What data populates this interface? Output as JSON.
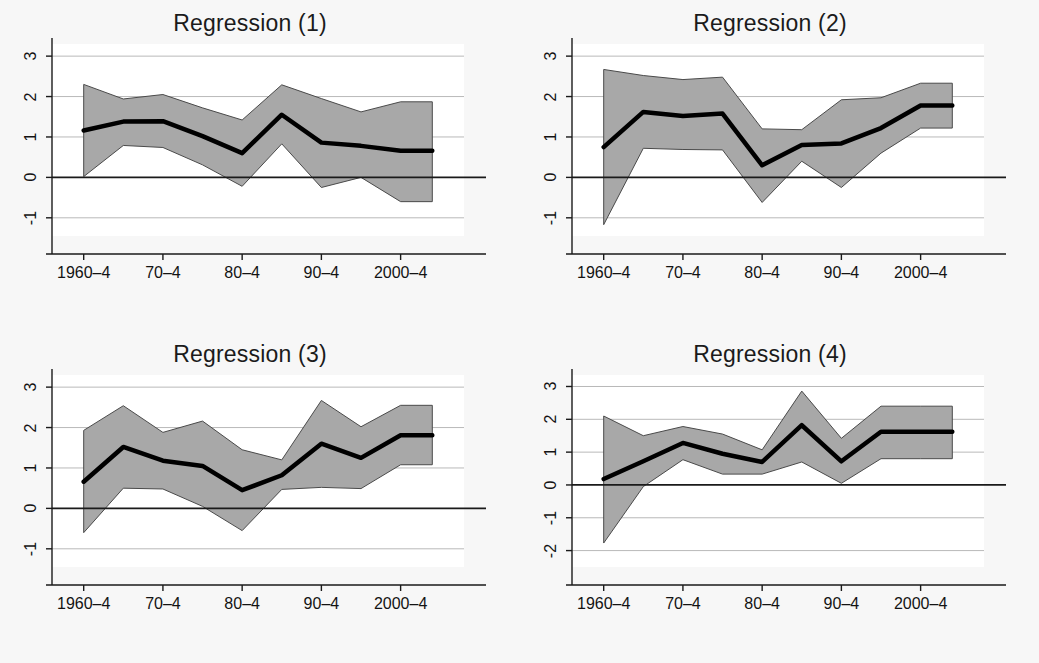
{
  "figure": {
    "background_color": "#f7f7f7",
    "plot_background_color": "#ffffff",
    "band_color": "#a8a8a8",
    "line_color": "#000000",
    "grid_color": "#b9b9b9",
    "axis_color": "#1a1a1a"
  },
  "chart_data": [
    {
      "type": "line",
      "title": "Regression (1)",
      "xlabel": "",
      "ylabel": "",
      "grid": true,
      "legend": "none",
      "x": [
        1960,
        1965,
        1970,
        1975,
        1980,
        1985,
        1990,
        1995,
        2000,
        2004
      ],
      "xtick_positions": [
        1960,
        1970,
        1980,
        1990,
        2000
      ],
      "xtick_labels": [
        "1960–4",
        "70–4",
        "80–4",
        "90–4",
        "2000–4"
      ],
      "ytick_values": [
        -1,
        0,
        1,
        2,
        3
      ],
      "ytick_labels": [
        "-1",
        "0",
        "1",
        "2",
        "3"
      ],
      "ylim": [
        -1.45,
        3.3
      ],
      "xlim": [
        1956,
        2008
      ],
      "series": [
        {
          "name": "coefficient",
          "values": [
            1.16,
            1.38,
            1.39,
            1.02,
            0.6,
            1.55,
            0.86,
            0.78,
            0.66,
            0.66
          ]
        },
        {
          "name": "ci_upper",
          "values": [
            2.3,
            1.94,
            2.05,
            1.72,
            1.42,
            2.29,
            1.95,
            1.62,
            1.87,
            1.87
          ]
        },
        {
          "name": "ci_lower",
          "values": [
            0.02,
            0.79,
            0.74,
            0.31,
            -0.22,
            0.83,
            -0.25,
            0.0,
            -0.6,
            -0.6
          ]
        }
      ]
    },
    {
      "type": "line",
      "title": "Regression (2)",
      "xlabel": "",
      "ylabel": "",
      "grid": true,
      "legend": "none",
      "x": [
        1960,
        1965,
        1970,
        1975,
        1980,
        1985,
        1990,
        1995,
        2000,
        2004
      ],
      "xtick_positions": [
        1960,
        1970,
        1980,
        1990,
        2000
      ],
      "xtick_labels": [
        "1960–4",
        "70–4",
        "80–4",
        "90–4",
        "2000–4"
      ],
      "ytick_values": [
        -1,
        0,
        1,
        2,
        3
      ],
      "ytick_labels": [
        "-1",
        "0",
        "1",
        "2",
        "3"
      ],
      "ylim": [
        -1.45,
        3.3
      ],
      "xlim": [
        1956,
        2008
      ],
      "series": [
        {
          "name": "coefficient",
          "values": [
            0.75,
            1.62,
            1.52,
            1.58,
            0.3,
            0.8,
            0.84,
            1.22,
            1.78,
            1.78
          ]
        },
        {
          "name": "ci_upper",
          "values": [
            2.67,
            2.52,
            2.42,
            2.48,
            1.2,
            1.18,
            1.92,
            1.97,
            2.33,
            2.33
          ]
        },
        {
          "name": "ci_lower",
          "values": [
            -1.17,
            0.72,
            0.69,
            0.68,
            -0.62,
            0.4,
            -0.25,
            0.6,
            1.22,
            1.22
          ]
        }
      ]
    },
    {
      "type": "line",
      "title": "Regression (3)",
      "xlabel": "",
      "ylabel": "",
      "grid": true,
      "legend": "none",
      "x": [
        1960,
        1965,
        1970,
        1975,
        1980,
        1985,
        1990,
        1995,
        2000,
        2004
      ],
      "xtick_positions": [
        1960,
        1970,
        1980,
        1990,
        2000
      ],
      "xtick_labels": [
        "1960–4",
        "70–4",
        "80–4",
        "90–4",
        "2000–4"
      ],
      "ytick_values": [
        -1,
        0,
        1,
        2,
        3
      ],
      "ytick_labels": [
        "-1",
        "0",
        "1",
        "2",
        "3"
      ],
      "ylim": [
        -1.45,
        3.3
      ],
      "xlim": [
        1956,
        2008
      ],
      "series": [
        {
          "name": "coefficient",
          "values": [
            0.66,
            1.52,
            1.18,
            1.05,
            0.45,
            0.82,
            1.6,
            1.25,
            1.81,
            1.81
          ]
        },
        {
          "name": "ci_upper",
          "values": [
            1.93,
            2.54,
            1.88,
            2.16,
            1.45,
            1.2,
            2.67,
            2.02,
            2.55,
            2.55
          ]
        },
        {
          "name": "ci_lower",
          "values": [
            -0.6,
            0.5,
            0.48,
            0.05,
            -0.55,
            0.47,
            0.52,
            0.49,
            1.08,
            1.08
          ]
        }
      ]
    },
    {
      "type": "line",
      "title": "Regression (4)",
      "xlabel": "",
      "ylabel": "",
      "grid": true,
      "legend": "none",
      "x": [
        1960,
        1965,
        1970,
        1975,
        1980,
        1985,
        1990,
        1995,
        2000,
        2004
      ],
      "xtick_positions": [
        1960,
        1970,
        1980,
        1990,
        2000
      ],
      "xtick_labels": [
        "1960–4",
        "70–4",
        "80–4",
        "90–4",
        "2000–4"
      ],
      "ytick_values": [
        -2,
        -1,
        0,
        1,
        2,
        3
      ],
      "ytick_labels": [
        "-2",
        "-1",
        "0",
        "1",
        "2",
        "3"
      ],
      "ylim": [
        -2.5,
        3.35
      ],
      "xlim": [
        1956,
        2008
      ],
      "series": [
        {
          "name": "coefficient",
          "values": [
            0.18,
            0.72,
            1.28,
            0.95,
            0.7,
            1.82,
            0.72,
            1.62,
            1.62,
            1.62
          ]
        },
        {
          "name": "ci_upper",
          "values": [
            2.1,
            1.5,
            1.78,
            1.55,
            1.07,
            2.86,
            1.42,
            2.4,
            2.4,
            2.4
          ]
        },
        {
          "name": "ci_lower",
          "values": [
            -1.77,
            -0.05,
            0.77,
            0.33,
            0.33,
            0.7,
            0.05,
            0.8,
            0.8,
            0.8
          ]
        }
      ]
    }
  ]
}
